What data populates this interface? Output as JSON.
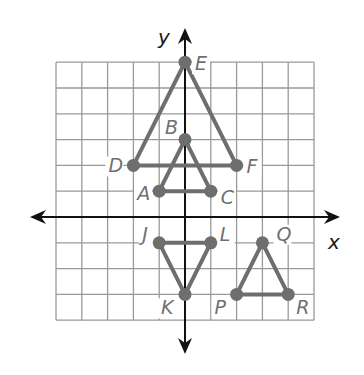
{
  "diagram": {
    "type": "coordinate-plane",
    "axes": {
      "x_label": "x",
      "y_label": "y"
    },
    "grid": {
      "x_min": -5,
      "x_max": 5,
      "y_min": -4,
      "y_max": 6,
      "unit_px": 25.8,
      "origin_px": [
        185,
        217
      ]
    },
    "colors": {
      "grid": "#9a9a9a",
      "axis": "#111111",
      "shape": "#6e6e6e",
      "label": "#6f6f6f"
    },
    "triangles": [
      {
        "name": "DEF",
        "vertices": [
          "D",
          "E",
          "F"
        ]
      },
      {
        "name": "ABC",
        "vertices": [
          "A",
          "B",
          "C"
        ]
      },
      {
        "name": "JKL",
        "vertices": [
          "J",
          "K",
          "L"
        ]
      },
      {
        "name": "PQR",
        "vertices": [
          "P",
          "Q",
          "R"
        ]
      }
    ],
    "points": [
      {
        "label": "E",
        "x": 0,
        "y": 6,
        "label_dx": 10,
        "label_dy": 8
      },
      {
        "label": "B",
        "x": 0,
        "y": 3,
        "label_dx": -20,
        "label_dy": -6
      },
      {
        "label": "D",
        "x": -2,
        "y": 2,
        "label_dx": -25,
        "label_dy": 7
      },
      {
        "label": "F",
        "x": 2,
        "y": 2,
        "label_dx": 10,
        "label_dy": 8
      },
      {
        "label": "A",
        "x": -1,
        "y": 1,
        "label_dx": -22,
        "label_dy": 9
      },
      {
        "label": "C",
        "x": 1,
        "y": 1,
        "label_dx": 10,
        "label_dy": 13
      },
      {
        "label": "J",
        "x": -1,
        "y": -1,
        "label_dx": -17,
        "label_dy": -2
      },
      {
        "label": "L",
        "x": 1,
        "y": -1,
        "label_dx": 9,
        "label_dy": -2
      },
      {
        "label": "K",
        "x": 0,
        "y": -3,
        "label_dx": -24,
        "label_dy": 20
      },
      {
        "label": "Q",
        "x": 3,
        "y": -1,
        "label_dx": 14,
        "label_dy": -2
      },
      {
        "label": "P",
        "x": 2,
        "y": -3,
        "label_dx": -22,
        "label_dy": 20
      },
      {
        "label": "R",
        "x": 4,
        "y": -3,
        "label_dx": 8,
        "label_dy": 20
      }
    ]
  }
}
